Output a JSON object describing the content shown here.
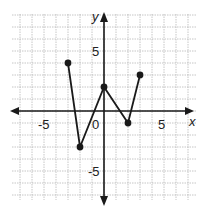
{
  "chart_data": {
    "type": "line",
    "title": "",
    "xlabel": "x",
    "ylabel": "y",
    "xlim": [
      -7.5,
      7.5
    ],
    "ylim": [
      -7.5,
      8
    ],
    "grid": true,
    "x_ticks_labeled": [
      -5,
      0,
      5
    ],
    "y_ticks_labeled": [
      5,
      -5
    ],
    "tick_labels": {
      "x_neg": "-5",
      "origin": "0",
      "x_pos": "5",
      "y_pos": "5",
      "y_neg": "-5"
    },
    "series": [
      {
        "name": "piecewise",
        "points": [
          {
            "x": -3,
            "y": 4
          },
          {
            "x": -2,
            "y": -3
          },
          {
            "x": 0,
            "y": 2
          },
          {
            "x": 2,
            "y": -1
          },
          {
            "x": 3,
            "y": 3
          }
        ]
      }
    ],
    "colors": {
      "line": "#1a1a1a",
      "grid": "#b8b8b8",
      "axis": "#1a1a1a"
    }
  }
}
